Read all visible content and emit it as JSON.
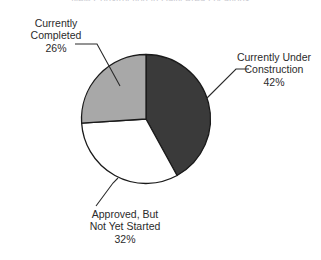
{
  "chart_data": {
    "type": "pie",
    "title": "New Construction in Daily Area Locations",
    "title_clipped": true,
    "xlabel": "",
    "ylabel": "",
    "legend_position": "callout-labels",
    "grid": false,
    "start_angle_deg": 0,
    "direction": "clockwise",
    "categories": [
      "Currently Under Construction",
      "Approved, But Not Yet Started",
      "Currently Completed"
    ],
    "values": [
      42,
      32,
      26
    ],
    "value_labels": [
      "42%",
      "32%",
      "26%"
    ],
    "colors": [
      "#3a3a3a",
      "#ffffff",
      "#a8a8a8"
    ],
    "slices": [
      {
        "name": "Currently Under Construction",
        "value": 42,
        "value_label": "42%",
        "color": "#3a3a3a",
        "label_line1": "Currently Under",
        "label_line2": "Construction"
      },
      {
        "name": "Approved, But Not Yet Started",
        "value": 32,
        "value_label": "32%",
        "color": "#ffffff",
        "label_line1": "Approved, But",
        "label_line2": "Not Yet Started"
      },
      {
        "name": "Currently Completed",
        "value": 26,
        "value_label": "26%",
        "color": "#a8a8a8",
        "label_line1": "Currently",
        "label_line2": "Completed"
      }
    ],
    "outline_color": "#1a1a1a",
    "background": "#ffffff"
  }
}
